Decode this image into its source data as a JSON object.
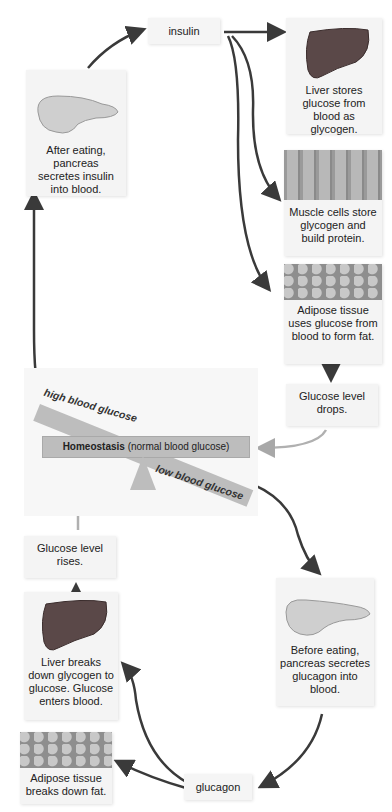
{
  "insulin_branch": {
    "hormone_label": "insulin",
    "pancreas_caption": "After eating, pancreas secretes insulin into blood.",
    "liver_caption": "Liver stores glucose from blood as glycogen.",
    "muscle_caption": "Muscle cells store glycogen and build protein.",
    "adipose_caption": "Adipose tissue uses glucose from blood to form fat.",
    "result": "Glucose level drops."
  },
  "homeostasis": {
    "title_bold": "Homeostasis",
    "title_rest": "(normal blood glucose)",
    "high_label": "high blood glucose",
    "low_label": "low blood glucose"
  },
  "glucagon_branch": {
    "hormone_label": "glucagon",
    "pancreas_caption": "Before eating, pancreas secretes glucagon into blood.",
    "liver_caption": "Liver breaks down glycogen to glucose. Glucose enters blood.",
    "adipose_caption": "Adipose tissue breaks down fat.",
    "result": "Glucose level rises."
  },
  "colors": {
    "arrow_dark": "#3a3a3a",
    "arrow_light": "#b0b0b0",
    "box_bg": "#f4f4f4",
    "seesaw": "#bdbdbd",
    "liver": "#5a4848",
    "pancreas": "#c9c9c9"
  }
}
